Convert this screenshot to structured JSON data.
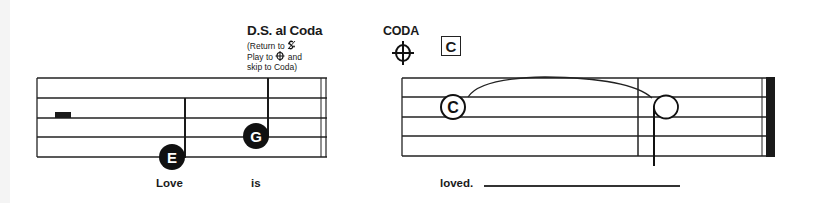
{
  "instructions": {
    "ds_al_coda": {
      "title": "D.S. al Coda",
      "line1": "(Return to",
      "line2": "Play to",
      "line2b": "and",
      "line3": "skip to Coda)"
    },
    "coda": {
      "label": "CODA",
      "symbol": "coda-sign",
      "section_marker": "C"
    }
  },
  "left_staff": {
    "rest": "half-rest",
    "notes": [
      {
        "letter": "E",
        "type": "quarter",
        "lyric": "Love"
      },
      {
        "letter": "G",
        "type": "quarter",
        "lyric": "is"
      }
    ],
    "ending_barline": "double-bar"
  },
  "right_staff": {
    "notes": [
      {
        "letter": "C",
        "type": "whole",
        "lyric": "loved."
      },
      {
        "letter": "",
        "type": "half",
        "tied": true,
        "lyric": ""
      }
    ],
    "ending_barline": "final-bar"
  },
  "lyrics": [
    "Love",
    "is",
    "loved."
  ],
  "colors": {
    "ink": "#1a1a1a",
    "paper": "#ffffff"
  }
}
